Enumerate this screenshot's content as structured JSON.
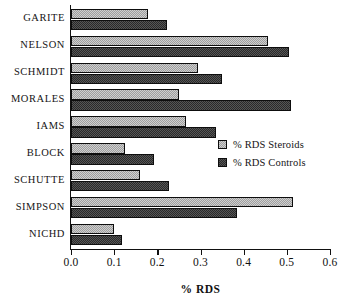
{
  "chart_data": {
    "type": "bar",
    "orientation": "horizontal",
    "title": "",
    "xlabel": "% RDS",
    "ylabel": "",
    "xlim": [
      0.0,
      0.6
    ],
    "xticks": [
      "0.0",
      "0.1",
      "0.2",
      "0.3",
      "0.4",
      "0.5",
      "0.6"
    ],
    "xtick_values": [
      0.0,
      0.1,
      0.2,
      0.3,
      0.4,
      0.5,
      0.6
    ],
    "grid": false,
    "legend_position": "center-right",
    "categories": [
      "GARITE",
      "NELSON",
      "SCHMIDT",
      "MORALES",
      "IAMS",
      "BLOCK",
      "SCHUTTE",
      "SIMPSON",
      "NICHD"
    ],
    "series": [
      {
        "name": "% RDS Steroids",
        "color": "#b6b6b6",
        "values": [
          0.178,
          0.456,
          0.295,
          0.25,
          0.267,
          0.125,
          0.16,
          0.515,
          0.1
        ]
      },
      {
        "name": "% RDS Controls",
        "color": "#3c3c3c",
        "values": [
          0.222,
          0.505,
          0.35,
          0.51,
          0.335,
          0.192,
          0.228,
          0.385,
          0.118
        ]
      }
    ]
  },
  "legend": {
    "items": [
      {
        "label": "% RDS Steroids",
        "swatch": "steroids"
      },
      {
        "label": "% RDS Controls",
        "swatch": "controls"
      }
    ]
  },
  "axis": {
    "x_title": "% RDS"
  }
}
